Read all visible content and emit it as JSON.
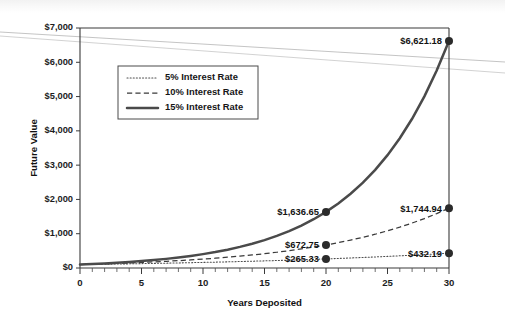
{
  "chart_data": {
    "type": "line",
    "title": "",
    "xlabel": "Years Deposited",
    "ylabel": "Future Value",
    "xlim": [
      0,
      30
    ],
    "ylim": [
      0,
      7000
    ],
    "grid": false,
    "legend_position": "upper-left-inside",
    "x_ticks": [
      0,
      5,
      10,
      15,
      20,
      25,
      30
    ],
    "x_tick_labels": [
      "0",
      "5",
      "10",
      "15",
      "20",
      "25",
      "30"
    ],
    "x_minor_tick_step": 1,
    "y_ticks": [
      0,
      1000,
      2000,
      3000,
      4000,
      5000,
      6000,
      7000
    ],
    "y_tick_labels": [
      "$0",
      "$1,000",
      "$2,000",
      "$3,000",
      "$4,000",
      "$5,000",
      "$6,000",
      "$7,000"
    ],
    "principal": 100,
    "x": [
      0,
      1,
      2,
      3,
      4,
      5,
      6,
      7,
      8,
      9,
      10,
      11,
      12,
      13,
      14,
      15,
      16,
      17,
      18,
      19,
      20,
      21,
      22,
      23,
      24,
      25,
      26,
      27,
      28,
      29,
      30
    ],
    "series": [
      {
        "name": "5% Interest Rate",
        "rate": 0.05,
        "style": "dotted",
        "color": "#4d4d4d",
        "values": [
          100,
          105,
          110.25,
          115.76,
          121.55,
          127.63,
          134.01,
          140.71,
          147.75,
          155.13,
          162.89,
          171.03,
          179.59,
          188.56,
          197.99,
          207.89,
          218.29,
          229.2,
          240.66,
          252.7,
          265.33,
          278.6,
          292.53,
          307.15,
          322.51,
          338.64,
          355.57,
          373.35,
          392.01,
          411.61,
          432.19
        ],
        "labeled_points": [
          {
            "x": 20,
            "y": 265.33,
            "label": "$265.33"
          },
          {
            "x": 30,
            "y": 432.19,
            "label": "$432.19"
          }
        ]
      },
      {
        "name": "10% Interest Rate",
        "rate": 0.1,
        "style": "dashed",
        "color": "#3a3a3a",
        "values": [
          100,
          110,
          121,
          133.1,
          146.41,
          161.05,
          177.16,
          194.87,
          214.36,
          235.79,
          259.37,
          285.31,
          313.84,
          345.23,
          379.75,
          417.72,
          459.5,
          505.45,
          555.99,
          611.59,
          672.75,
          740.02,
          814.03,
          895.43,
          984.97,
          1083.47,
          1191.82,
          1311,
          1442.1,
          1586.31,
          1744.94
        ],
        "labeled_points": [
          {
            "x": 20,
            "y": 672.75,
            "label": "$672.75"
          },
          {
            "x": 30,
            "y": 1744.94,
            "label": "$1,744.94"
          }
        ]
      },
      {
        "name": "15% Interest Rate",
        "rate": 0.15,
        "style": "solid",
        "color": "#4a4a4a",
        "values": [
          100,
          115,
          132.25,
          152.09,
          174.9,
          201.14,
          231.31,
          266.0,
          305.9,
          351.79,
          404.56,
          465.24,
          535.03,
          615.28,
          707.57,
          813.71,
          935.76,
          1076.13,
          1237.54,
          1423.18,
          1636.65,
          1882.15,
          2164.47,
          2489.15,
          2862.52,
          3291.9,
          3785.68,
          4353.53,
          5006.56,
          5757.55,
          6621.18
        ],
        "labeled_points": [
          {
            "x": 20,
            "y": 1636.65,
            "label": "$1,636.65"
          },
          {
            "x": 30,
            "y": 6621.18,
            "label": "$6,621.18"
          }
        ]
      }
    ],
    "legend_entries": [
      {
        "label": "5% Interest Rate",
        "style": "dotted"
      },
      {
        "label": "10% Interest Rate",
        "style": "dashed"
      },
      {
        "label": "15% Interest Rate",
        "style": "solid"
      }
    ]
  }
}
